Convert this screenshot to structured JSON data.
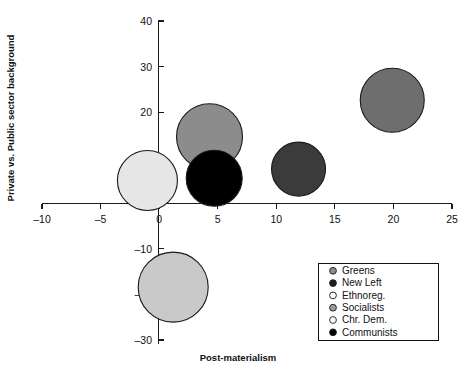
{
  "chart_data": {
    "type": "scatter",
    "title": "",
    "xlabel": "Post-materialism",
    "ylabel": "Private vs. Public sector background",
    "xlim": [
      -10,
      25
    ],
    "ylim": [
      -30,
      40
    ],
    "xticks": [
      -10,
      -5,
      0,
      5,
      10,
      15,
      20,
      25
    ],
    "xtick_labels": [
      "–10",
      "–5",
      "0",
      "5",
      "10",
      "15",
      "20",
      "25"
    ],
    "yticks": [
      40,
      30,
      20,
      -10,
      -20,
      -30
    ],
    "ytick_labels": [
      "40",
      "30",
      "20",
      "–10",
      "–20",
      "–30"
    ],
    "grid": false,
    "legend_position": "bottom-right",
    "marker_shape": "circle",
    "points": [
      {
        "name": "Greens",
        "x": 4.3,
        "y": 14.6,
        "size": 33,
        "color": "#8c8c8c"
      },
      {
        "name": "New Left",
        "x": 11.9,
        "y": 7.5,
        "size": 27,
        "color": "#3b3b3b"
      },
      {
        "name": "Ethnoreg.",
        "x": -1.0,
        "y": 5.0,
        "size": 30,
        "color": "#e6e6e6"
      },
      {
        "name": "Socialists",
        "x": 1.2,
        "y": -18.4,
        "size": 35,
        "color": "#c9c9c9"
      },
      {
        "name": "Chr. Dem.",
        "x": 19.9,
        "y": 22.6,
        "size": 32,
        "color": "#6e6e6e"
      },
      {
        "name": "Communists",
        "x": 4.7,
        "y": 5.5,
        "size": 28,
        "color": "#000000"
      }
    ],
    "legend": [
      {
        "label": "Greens",
        "color": "#8c8c8c"
      },
      {
        "label": "New Left",
        "color": "#1c1c1c"
      },
      {
        "label": "Ethnoreg.",
        "color": "#fbfbfb"
      },
      {
        "label": "Socialists",
        "color": "#9a9a9a"
      },
      {
        "label": "Chr. Dem.",
        "color": "#fdfdfd"
      },
      {
        "label": "Communists",
        "color": "#000000"
      }
    ]
  },
  "axes": {
    "x_title": "Post-materialism",
    "y_title": "Private vs. Public sector background"
  }
}
